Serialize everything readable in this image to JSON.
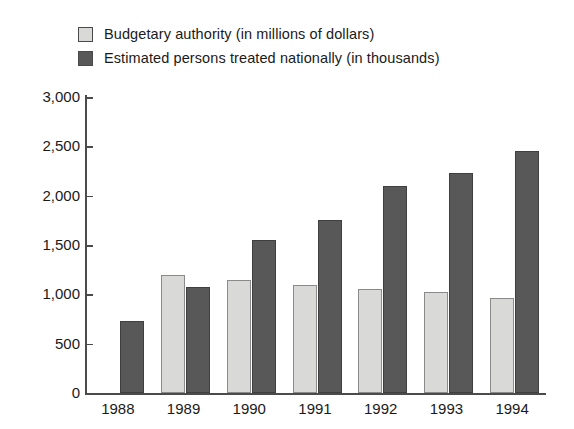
{
  "legend": {
    "items": [
      {
        "label": "Budgetary authority (in millions of dollars)",
        "swatch": "light",
        "color": "#d9d9d7"
      },
      {
        "label": "Estimated persons treated nationally (in thousands)",
        "swatch": "dark",
        "color": "#585859"
      }
    ]
  },
  "chart_data": {
    "type": "bar",
    "title": "",
    "xlabel": "",
    "ylabel": "",
    "ylim": [
      0,
      3000
    ],
    "yticks": [
      0,
      500,
      1000,
      1500,
      2000,
      2500,
      3000
    ],
    "ytick_labels": [
      "0",
      "500",
      "1,000",
      "1,500",
      "2,000",
      "2,500",
      "3,000"
    ],
    "grid": false,
    "legend_position": "top-left",
    "categories": [
      "1988",
      "1989",
      "1990",
      "1991",
      "1992",
      "1993",
      "1994"
    ],
    "series": [
      {
        "name": "Budgetary authority (in millions of dollars)",
        "color": "#d9d9d7",
        "values": [
          null,
          1200,
          1150,
          1090,
          1050,
          1020,
          960
        ]
      },
      {
        "name": "Estimated persons treated nationally (in thousands)",
        "color": "#585859",
        "values": [
          730,
          1070,
          1550,
          1750,
          2100,
          2230,
          2450
        ]
      }
    ]
  }
}
